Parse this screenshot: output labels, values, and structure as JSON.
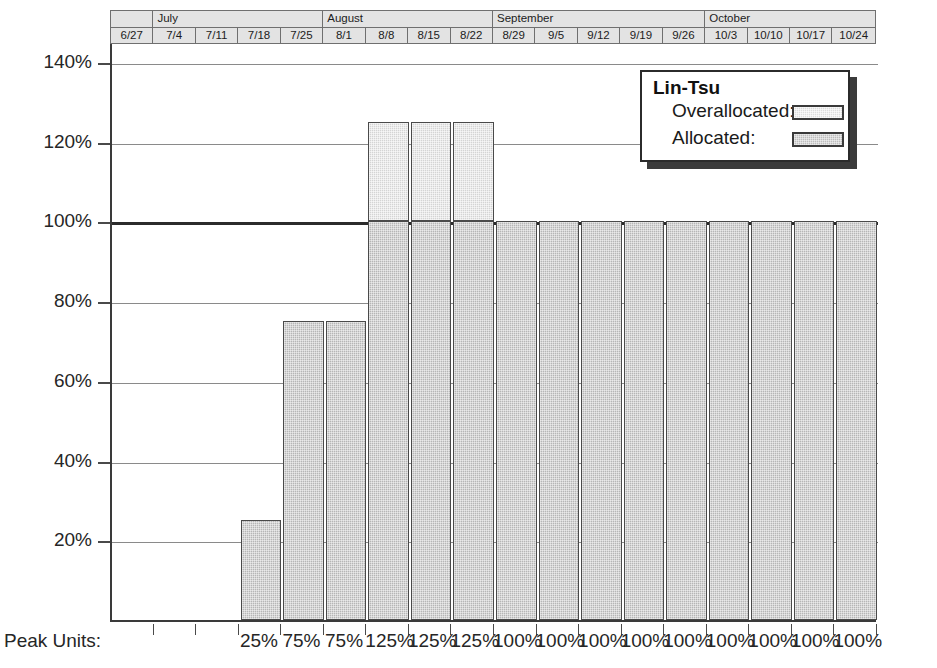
{
  "chart_data": {
    "type": "bar",
    "title": "",
    "xlabel": "",
    "ylabel": "",
    "ylim": [
      0,
      145
    ],
    "grid": true,
    "threshold": 100,
    "legend_position": "top-right",
    "categories": [
      "6/27",
      "7/4",
      "7/11",
      "7/18",
      "7/25",
      "8/1",
      "8/8",
      "8/15",
      "8/22",
      "8/29",
      "9/5",
      "9/12",
      "9/19",
      "9/26",
      "10/3",
      "10/10",
      "10/17",
      "10/24"
    ],
    "values": [
      0,
      0,
      0,
      25,
      75,
      75,
      125,
      125,
      125,
      100,
      100,
      100,
      100,
      100,
      100,
      100,
      100,
      100
    ],
    "series": [
      {
        "name": "Allocated",
        "values": [
          0,
          0,
          0,
          25,
          75,
          75,
          100,
          100,
          100,
          100,
          100,
          100,
          100,
          100,
          100,
          100,
          100,
          100
        ]
      },
      {
        "name": "Overallocated",
        "values": [
          0,
          0,
          0,
          0,
          0,
          0,
          25,
          25,
          25,
          0,
          0,
          0,
          0,
          0,
          0,
          0,
          0,
          0
        ]
      }
    ],
    "ytick_labels": [
      "140%",
      "120%",
      "100%",
      "80%",
      "60%",
      "40%",
      "20%"
    ],
    "ytick_values": [
      140,
      120,
      100,
      80,
      60,
      40,
      20
    ],
    "peak_units": [
      "",
      "",
      "",
      "25%",
      "75%",
      "75%",
      "125%",
      "125%",
      "125%",
      "100%",
      "100%",
      "100%",
      "100%",
      "100%",
      "100%",
      "100%",
      "100%",
      "100%"
    ]
  },
  "timescale": {
    "months": [
      {
        "label": "",
        "span": 1
      },
      {
        "label": "July",
        "span": 4
      },
      {
        "label": "August",
        "span": 4
      },
      {
        "label": "September",
        "span": 5
      },
      {
        "label": "October",
        "span": 4
      }
    ],
    "weeks": [
      "6/27",
      "7/4",
      "7/11",
      "7/18",
      "7/25",
      "8/1",
      "8/8",
      "8/15",
      "8/22",
      "8/29",
      "9/5",
      "9/12",
      "9/19",
      "9/26",
      "10/3",
      "10/10",
      "10/17",
      "10/24"
    ]
  },
  "axis": {
    "y_labels": [
      "140%",
      "120%",
      "100%",
      "80%",
      "60%",
      "40%",
      "20%"
    ],
    "peak_units_label": "Peak Units:"
  },
  "legend": {
    "title": "Lin-Tsu",
    "rows": [
      {
        "label": "Overallocated:",
        "swatch": "overallocated-swatch"
      },
      {
        "label": "Allocated:",
        "swatch": "allocated-swatch"
      }
    ]
  },
  "colors": {
    "allocated": "#b6b6b6",
    "overallocated": "#d4d4d4",
    "gridline": "#8a8a8a",
    "threshold_line": "#2b2b2b",
    "axis": "#3a3a3a",
    "header_bg": "#e3e3e3"
  }
}
